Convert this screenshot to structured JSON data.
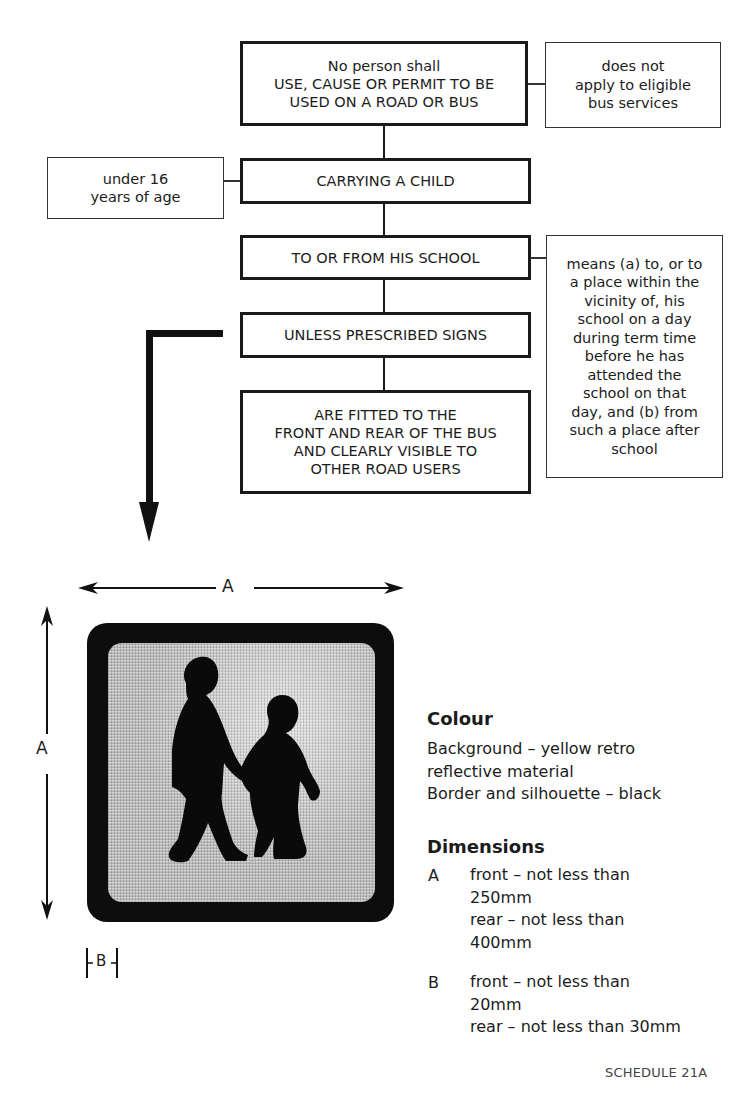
{
  "flowchart": {
    "main_boxes": [
      {
        "text": "No person shall\nUSE, CAUSE OR PERMIT TO BE\nUSED ON A ROAD OR BUS"
      },
      {
        "text": "CARRYING A CHILD"
      },
      {
        "text": "TO OR FROM HIS SCHOOL"
      },
      {
        "text": "UNLESS PRESCRIBED SIGNS"
      },
      {
        "text": "ARE FITTED TO THE\nFRONT AND REAR OF THE BUS\nAND CLEARLY VISIBLE TO\nOTHER ROAD USERS"
      }
    ],
    "side_notes": [
      {
        "attached_to": 0,
        "text": "does not\napply to eligible\nbus services"
      },
      {
        "attached_to": 1,
        "text": "under 16\nyears of age"
      },
      {
        "attached_to": 2,
        "text": "means (a) to, or to\na place within the\nvicinity of, his\nschool on a day\nduring term time\nbefore he has\nattended the\nschool on that\nday, and (b) from\nsuch a place after\nschool"
      }
    ]
  },
  "sign": {
    "description": "school children silhouette sign",
    "dimension_width_label": "A",
    "dimension_height_label": "A",
    "dimension_border_label": "B"
  },
  "colour": {
    "heading": "Colour",
    "lines": "Background – yellow retro\nreflective material\nBorder and silhouette – black"
  },
  "dimensions": {
    "heading": "Dimensions",
    "items": [
      {
        "label": "A",
        "text": "front – not less than\n250mm\nrear – not less than\n400mm"
      },
      {
        "label": "B",
        "text": "front – not less than\n20mm\nrear – not less than 30mm"
      }
    ]
  },
  "footer": {
    "text": "SCHEDULE 21A"
  }
}
